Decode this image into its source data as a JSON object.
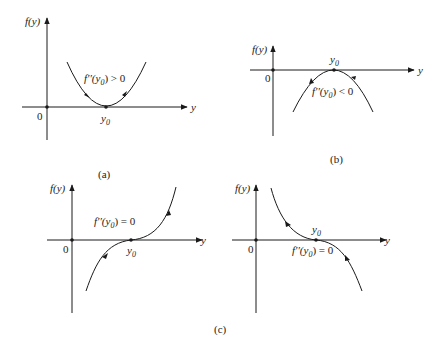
{
  "figure": {
    "panels": [
      {
        "id": "a",
        "caption": "(a)",
        "y_axis_label": "f(y)",
        "x_axis_label": "y",
        "origin_label": "0",
        "point_label": "y",
        "point_subscript": "0",
        "condition_prefix": "f′′(y",
        "condition_subscript": "0",
        "condition_suffix": ") > 0",
        "curve": "parabola opening upward, tangent to y-axis at y0",
        "arrows": "both point toward y0 (left side descending right, right side pointing up-right away)"
      },
      {
        "id": "b",
        "caption": "(b)",
        "y_axis_label": "f(y)",
        "x_axis_label": "y",
        "origin_label": "0",
        "point_label": "y",
        "point_subscript": "0",
        "condition_prefix": "f′′(y",
        "condition_subscript": "0",
        "condition_suffix": ") < 0",
        "curve": "parabola opening downward, tangent to y-axis at y0"
      },
      {
        "id": "c-left",
        "y_axis_label": "f(y)",
        "x_axis_label": "y",
        "origin_label": "0",
        "point_label": "y",
        "point_subscript": "0",
        "condition_prefix": "f′′(y",
        "condition_subscript": "0",
        "condition_suffix": ") = 0",
        "curve": "increasing cubic with inflection at y0"
      },
      {
        "id": "c-right",
        "y_axis_label": "f(y)",
        "x_axis_label": "y",
        "origin_label": "0",
        "point_label": "y",
        "point_subscript": "0",
        "condition_prefix": "f′′(y",
        "condition_subscript": "0",
        "condition_suffix": ") = 0",
        "curve": "decreasing cubic with inflection at y0"
      }
    ],
    "shared_caption": "(c)",
    "colors": {
      "line": "#1a1a1a",
      "text": "#222222",
      "background": "#ffffff"
    }
  }
}
